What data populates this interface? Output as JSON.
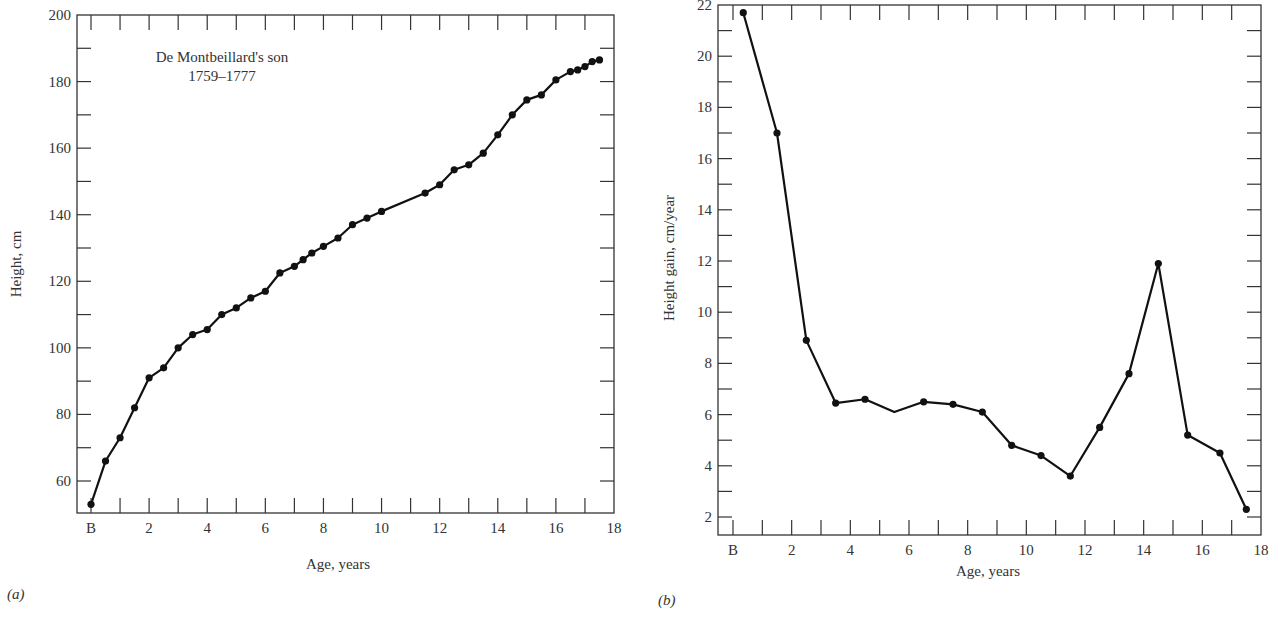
{
  "chart_data": [
    {
      "id": "a",
      "type": "line",
      "panel_label": "(a)",
      "title": "",
      "annotation": [
        "De Montbeillard's son",
        "1759–1777"
      ],
      "xlabel": "Age, years",
      "ylabel": "Height, cm",
      "xlim": [
        -0.5,
        18
      ],
      "ylim": [
        50,
        200
      ],
      "xticks": [
        {
          "value": 0,
          "label": "B"
        },
        {
          "value": 2,
          "label": "2"
        },
        {
          "value": 4,
          "label": "4"
        },
        {
          "value": 6,
          "label": "6"
        },
        {
          "value": 8,
          "label": "8"
        },
        {
          "value": 10,
          "label": "10"
        },
        {
          "value": 12,
          "label": "12"
        },
        {
          "value": 14,
          "label": "14"
        },
        {
          "value": 16,
          "label": "16"
        },
        {
          "value": 18,
          "label": "18"
        }
      ],
      "yticks": [
        60,
        80,
        100,
        120,
        140,
        160,
        180,
        200
      ],
      "grid": false,
      "legend": null,
      "series": [
        {
          "name": "Height",
          "x": [
            0,
            0.5,
            1,
            1.5,
            2,
            2.5,
            3,
            3.5,
            4,
            4.5,
            5,
            5.5,
            6,
            6.5,
            7,
            7.3,
            7.6,
            8,
            8.5,
            9,
            9.5,
            10,
            11.5,
            12,
            12.5,
            13,
            13.5,
            14,
            14.5,
            15,
            15.5,
            16,
            16.5,
            16.75,
            17,
            17.25,
            17.5
          ],
          "values": [
            53,
            66,
            73,
            82,
            91,
            94,
            100,
            104,
            105.5,
            110,
            112,
            115,
            117,
            122.5,
            124.5,
            126.5,
            128.5,
            130.5,
            133,
            137,
            139,
            141,
            146.5,
            149,
            153.5,
            155,
            158.5,
            164,
            170,
            174.5,
            176,
            180.5,
            183,
            183.5,
            184.5,
            186,
            186.5
          ]
        }
      ]
    },
    {
      "id": "b",
      "type": "line",
      "panel_label": "(b)",
      "title": "",
      "xlabel": "Age, years",
      "ylabel": "Height gain, cm/year",
      "xlim": [
        -0.5,
        18
      ],
      "ylim": [
        2,
        22
      ],
      "xticks": [
        {
          "value": 0,
          "label": "B"
        },
        {
          "value": 2,
          "label": "2"
        },
        {
          "value": 4,
          "label": "4"
        },
        {
          "value": 6,
          "label": "6"
        },
        {
          "value": 8,
          "label": "8"
        },
        {
          "value": 10,
          "label": "10"
        },
        {
          "value": 12,
          "label": "12"
        },
        {
          "value": 14,
          "label": "14"
        },
        {
          "value": 16,
          "label": "16"
        },
        {
          "value": 18,
          "label": "18"
        }
      ],
      "yticks": [
        2,
        4,
        6,
        8,
        10,
        12,
        14,
        16,
        18,
        20,
        22
      ],
      "grid": false,
      "legend": null,
      "series": [
        {
          "name": "Height gain",
          "x": [
            0.35,
            1.5,
            2.5,
            3.5,
            4.5,
            5.5,
            6.5,
            7.5,
            8.5,
            9.5,
            10.5,
            11.5,
            12.5,
            13.5,
            14.5,
            15.5,
            16.6,
            17.5
          ],
          "values": [
            21.7,
            17.0,
            8.9,
            6.45,
            6.6,
            6.1,
            6.5,
            6.4,
            6.1,
            4.8,
            4.4,
            3.6,
            5.5,
            7.6,
            11.9,
            5.2,
            4.5,
            2.3
          ],
          "markers": [
            true,
            true,
            true,
            true,
            true,
            false,
            true,
            true,
            true,
            true,
            true,
            true,
            true,
            true,
            true,
            true,
            true,
            true
          ]
        }
      ]
    }
  ]
}
